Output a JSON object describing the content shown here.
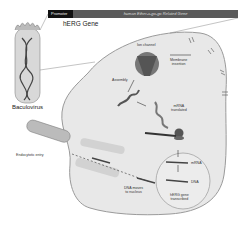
{
  "gene_bar": {
    "promoter_label": "Promoter",
    "gene_label": "human Ether-a-go-go Related Gene",
    "title": "hERG Gene"
  },
  "virus": {
    "label": "Baculovirus"
  },
  "steps": {
    "entry": "Endocytotic entry",
    "dna_moves": [
      "DNA moves",
      "to nucleus"
    ],
    "transcribed": [
      "hERG gene",
      "transcribed"
    ],
    "dna": "DNA",
    "mrna": "mRNA",
    "mrna_translated": [
      "mRNA",
      "translated"
    ],
    "assembly": "Assembly",
    "ion_channel": "Ion channel",
    "membrane_insertion": [
      "Membrane",
      "insertion"
    ]
  },
  "colors": {
    "cell_fill": "#e8e8e8",
    "cell_stroke": "#999999",
    "promoter": "#111111",
    "gene_bar": "#5a5a5a"
  }
}
